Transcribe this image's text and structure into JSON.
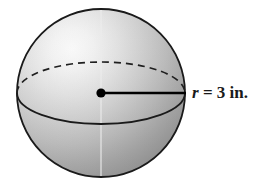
{
  "figure": {
    "type": "solid-geometry-diagram",
    "shape_name": "sphere",
    "background_color": "#ffffff",
    "outline_color": "#1a1a1a",
    "shading": {
      "highlight_color": "#f4f4f4",
      "midtone_color": "#c9c9c9",
      "shadow_color": "#9e9e9e",
      "edge_color": "#8c8c8c",
      "light_source": "upper-left"
    },
    "sphere": {
      "center_x": 101,
      "center_y": 93,
      "radius_px": 84
    },
    "equator": {
      "rx": 84,
      "ry": 31,
      "back_half_style": "dashed",
      "front_half_style": "solid",
      "dash_pattern": "7 5"
    },
    "meridian": {
      "visible": true,
      "x": 101,
      "color": "#e8e8e8"
    },
    "center_point": {
      "x": 101,
      "y": 93,
      "dot_radius": 4.6,
      "color": "#000000"
    },
    "radius_segment": {
      "from_x": 101,
      "from_y": 93,
      "to_x": 186,
      "to_y": 93,
      "color": "#000000",
      "width": 2.4
    }
  },
  "labels": {
    "radius": {
      "variable": "r",
      "rest": " = 3 in.",
      "full_text": "r = 3 in.",
      "value": 3,
      "unit": "in.",
      "x": 192,
      "y": 93
    }
  }
}
